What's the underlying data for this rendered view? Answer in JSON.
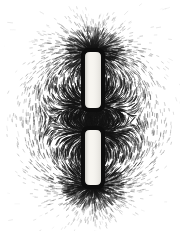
{
  "figure": {
    "kind": "photograph",
    "width": 183,
    "height": 239,
    "background_color": "#ffffff",
    "filing_color": "#141414",
    "medium": "iron filings on paper over bar magnets",
    "caption": ""
  },
  "chart_data": {
    "type": "scatter",
    "xlabel": "",
    "ylabel": "",
    "xlim": [
      0,
      183
    ],
    "ylim": [
      0,
      239
    ],
    "grid": false,
    "legend": "none",
    "colors": {
      "background": "#ffffff",
      "filings": "#141414",
      "magnet_body": "#f7f5f0",
      "magnet_outline": "#0d0d0d"
    },
    "magnets": [
      {
        "name": "upper-bar-magnet",
        "x": 85,
        "y": 52,
        "width": 16,
        "height": 56,
        "body_color": "#f7f5f0",
        "outline_color": "#0d0d0d",
        "outline_width": 4,
        "corner_radius": 6,
        "top_pole": "outward",
        "bottom_pole": "inward"
      },
      {
        "name": "lower-bar-magnet",
        "x": 85,
        "y": 130,
        "width": 16,
        "height": 55,
        "body_color": "#f7f5f0",
        "outline_color": "#0d0d0d",
        "outline_width": 4,
        "corner_radius": 6,
        "top_pole": "inward",
        "bottom_pole": "outward"
      }
    ],
    "poles": [
      {
        "name": "top-outer-pole",
        "x": 93,
        "y": 52,
        "polarity": "N",
        "intensity": 1.0
      },
      {
        "name": "upper-inner-pole",
        "x": 93,
        "y": 108,
        "polarity": "S",
        "intensity": 0.95
      },
      {
        "name": "lower-inner-pole",
        "x": 93,
        "y": 130,
        "polarity": "N",
        "intensity": 0.95
      },
      {
        "name": "bottom-outer-pole",
        "x": 93,
        "y": 185,
        "polarity": "S",
        "intensity": 1.0
      }
    ],
    "field_extent": {
      "left": 12,
      "right": 176,
      "top": 14,
      "bottom": 226,
      "dense_core_radius": 70,
      "fade_margin": 26
    },
    "filing_stats": {
      "approx_count": 9000,
      "mean_length_px": 5.2,
      "min_length_px": 2.0,
      "max_length_px": 9.0,
      "stroke_width_px": 0.65
    },
    "regions": [
      {
        "name": "top-radial-fan",
        "center_x": 93,
        "center_y": 52,
        "description": "dense radial spray fanning upward and outward from top pole"
      },
      {
        "name": "inner-gap-bridge",
        "center_x": 93,
        "center_y": 119,
        "description": "dense near-vertical filings bridging the facing inner poles"
      },
      {
        "name": "left-return-loops",
        "center_x": 48,
        "center_y": 119,
        "description": "concentric curved arcs looping from top pole around to bottom pole"
      },
      {
        "name": "right-return-loops",
        "center_x": 138,
        "center_y": 119,
        "description": "mirrored concentric curved arcs on the right side"
      },
      {
        "name": "bottom-radial-fan",
        "center_x": 93,
        "center_y": 185,
        "description": "dense radial spray fanning downward and outward from bottom pole"
      },
      {
        "name": "outer-fade",
        "center_x": 93,
        "center_y": 119,
        "description": "sparse scattered filings fading to white paper at the margins"
      }
    ]
  }
}
